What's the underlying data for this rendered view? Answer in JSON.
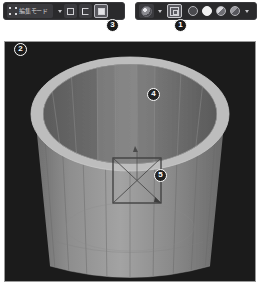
{
  "app": {
    "title": "Blender 3D Viewport"
  },
  "toolbar_left": {
    "name": "header-left",
    "mode_icon": "edit-mode-icon",
    "mode_label": "編集モード",
    "mode_caret": "chevron-down-icon",
    "select_modes": [
      {
        "name": "vertex-select",
        "icon": "vertex-select-icon",
        "active": false
      },
      {
        "name": "edge-select",
        "icon": "edge-select-icon",
        "active": false
      },
      {
        "name": "face-select",
        "icon": "face-select-icon",
        "active": true
      }
    ]
  },
  "toolbar_right": {
    "name": "header-right",
    "transform_orientation": {
      "icon": "gizmo-sphere-icon",
      "caret": "chevron-down-icon"
    },
    "xray_toggle": {
      "icon": "toggle-xray-icon",
      "active": true
    },
    "shading_modes": [
      {
        "name": "shading-wireframe",
        "icon": "wireframe-sphere-icon",
        "active": false
      },
      {
        "name": "shading-solid",
        "icon": "solid-sphere-icon",
        "active": true
      },
      {
        "name": "shading-material",
        "icon": "material-sphere-icon",
        "active": false
      },
      {
        "name": "shading-rendered",
        "icon": "rendered-sphere-icon",
        "active": false
      }
    ],
    "shading_caret": "chevron-down-icon"
  },
  "callouts": [
    {
      "id": "1",
      "label": "1",
      "x": 174,
      "y": 19,
      "target": "xray-toggle-button"
    },
    {
      "id": "2",
      "label": "2",
      "x": 14,
      "y": 43,
      "target": "viewport"
    },
    {
      "id": "3",
      "label": "3",
      "x": 106,
      "y": 19,
      "target": "face-select-button"
    },
    {
      "id": "4",
      "label": "4",
      "x": 147,
      "y": 88,
      "target": "cup-interior-face"
    },
    {
      "id": "5",
      "label": "5",
      "x": 154,
      "y": 169,
      "target": "box-select-region"
    }
  ],
  "viewport": {
    "name": "3d-viewport",
    "background_color": "#1b1b1b",
    "border_color": "#9a9a9a",
    "object": {
      "name": "cup-mesh",
      "type": "cylinder-cup",
      "rim_color": "#b9b9b9",
      "outer_wall_color": "#8f8f8f",
      "interior_color": "#6e6e6e",
      "shadow_color": "#5d5d5d",
      "wire_color": "#7a7a7a",
      "segments": 16
    },
    "box_select": {
      "name": "box-select-region",
      "x": 108,
      "y": 116,
      "width": 48,
      "height": 45,
      "stroke_color": "#3a3a3a",
      "diagonals": true
    }
  }
}
